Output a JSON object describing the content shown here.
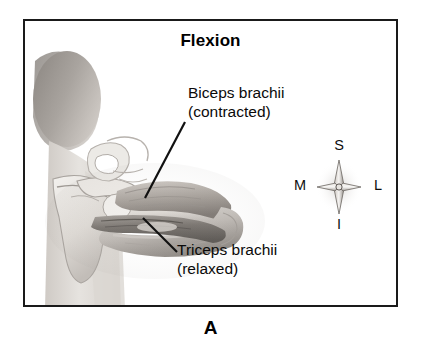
{
  "figure": {
    "letter": "A",
    "title": "Flexion"
  },
  "labels": {
    "biceps": {
      "line1": "Biceps brachii",
      "line2": "(contracted)"
    },
    "triceps": {
      "line1": "Triceps brachii",
      "line2": "(relaxed)"
    }
  },
  "compass": {
    "superior": "S",
    "inferior": "I",
    "medial": "M",
    "lateral": "L"
  },
  "colors": {
    "frame": "#1a1a1a",
    "text": "#0a0a0a",
    "background": "#ffffff",
    "skin_light": "#e9e6e2",
    "skin_mid": "#d2cdc8",
    "bone_light": "#f1efec",
    "muscle_mid": "#9e9892",
    "muscle_dark": "#6f6a66",
    "hair_dark": "#8d8882",
    "leader_line": "#111111"
  }
}
